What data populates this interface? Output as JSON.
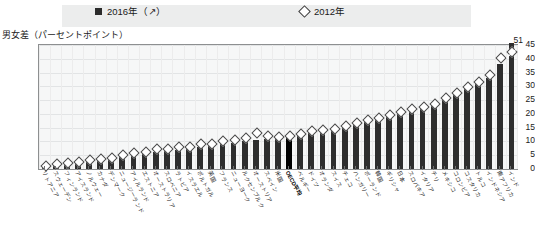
{
  "legend": {
    "series_2016": {
      "label": "2016年（↗）",
      "marker": "filled-square",
      "color": "#2e2e2e"
    },
    "series_2012": {
      "label": "2012年",
      "marker": "open-diamond",
      "color": "#ffffff"
    }
  },
  "axis": {
    "y_title": "男女差（パーセントポイント）",
    "y_ticks": [
      "45",
      "40",
      "35",
      "30",
      "25",
      "20",
      "15",
      "10",
      "5",
      "0"
    ]
  },
  "annotations": {
    "top_value": "51"
  },
  "chart_data": {
    "type": "bar",
    "title": "",
    "subtitle": "",
    "xlabel": "",
    "ylabel": "男女差（パーセントポイント）",
    "ylim": [
      0,
      45
    ],
    "grid": true,
    "legend_position": "top",
    "categories": [
      "リトアニア",
      "スウェーデン",
      "フィンランド",
      "アイスランド",
      "ノルウェー",
      "カナダ",
      "デンマーク",
      "ニュージーランド",
      "アイルランド",
      "エストニア",
      "オーストラリア",
      "スロベニア",
      "ラトビア",
      "イスラエル",
      "ポルトガル",
      "英国",
      "フランス",
      "ニューヨーク",
      "ルクセンブルク",
      "オーストリア",
      "スペイン",
      "米国",
      "OECD平均",
      "ベルギー",
      "ドイツ",
      "オランダ",
      "スイス",
      "チェコ",
      "ハンガリー",
      "ポーランド",
      "韓国",
      "ギリシャ",
      "日本",
      "スロバキア",
      "イタリア",
      "チリ",
      "メキシコ",
      "コロンビア",
      "コスタリカ",
      "トルコ",
      "インドネシア",
      "南アフリカ",
      "インド"
    ],
    "series": [
      {
        "name": "2016年（↗）",
        "values": [
          1.0,
          1.5,
          2.0,
          2.5,
          3.0,
          3.5,
          4.0,
          4.5,
          5.0,
          5.5,
          6.0,
          6.5,
          7.0,
          7.5,
          8.0,
          8.5,
          9.0,
          9.5,
          10.0,
          10.5,
          11.0,
          11.5,
          11.5,
          12.0,
          13.0,
          13.5,
          14.0,
          15.0,
          16.0,
          17.0,
          18.0,
          19.0,
          20.0,
          21.0,
          22.0,
          23.0,
          25.0,
          27.0,
          29.0,
          31.0,
          33.0,
          38.0,
          51.0
        ]
      },
      {
        "name": "2012年",
        "values": [
          1.5,
          2.0,
          2.5,
          3.0,
          3.5,
          4.0,
          4.5,
          5.5,
          6.0,
          6.5,
          7.5,
          7.5,
          8.5,
          8.5,
          9.5,
          9.5,
          10.5,
          11.0,
          11.5,
          13.5,
          12.5,
          12.0,
          12.5,
          13.0,
          14.0,
          14.5,
          15.0,
          16.0,
          17.0,
          18.0,
          19.0,
          20.0,
          21.0,
          22.0,
          23.0,
          24.0,
          26.0,
          28.0,
          30.0,
          32.0,
          34.5,
          40.5,
          43.0
        ]
      }
    ],
    "highlight_index": 22,
    "clipped_bar": {
      "index": 42,
      "value": 51,
      "label": "51"
    }
  }
}
